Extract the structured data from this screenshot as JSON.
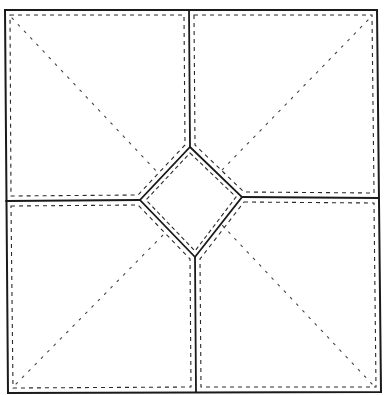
{
  "diagram": {
    "title": "",
    "width": 388,
    "height": 395,
    "background": "#ffffff",
    "colors": {
      "seam": "#1a1a1a",
      "stitch": "#2a2a2a",
      "quilt": "#444444"
    },
    "outer_frame": [
      [
        5,
        10
      ],
      [
        377,
        10
      ],
      [
        381,
        392
      ],
      [
        8,
        393
      ]
    ],
    "center_diamond": {
      "top": [
        190,
        147
      ],
      "right": [
        242,
        197
      ],
      "bottom": [
        195,
        257
      ],
      "left": [
        140,
        200
      ]
    },
    "seams": [
      {
        "name": "top-seam",
        "from": [
          189,
          10
        ],
        "to": [
          190,
          147
        ]
      },
      {
        "name": "right-seam",
        "from": [
          242,
          197
        ],
        "to": [
          379,
          198
        ]
      },
      {
        "name": "bottom-seam",
        "from": [
          195,
          257
        ],
        "to": [
          196,
          392
        ]
      },
      {
        "name": "left-seam",
        "from": [
          6,
          201
        ],
        "to": [
          140,
          200
        ]
      }
    ],
    "panels": [
      {
        "name": "panel-top-left",
        "outline": [
          [
            5,
            10
          ],
          [
            189,
            10
          ],
          [
            190,
            147
          ],
          [
            140,
            200
          ],
          [
            6,
            201
          ]
        ],
        "stitch_inset": [
          [
            10,
            15
          ],
          [
            184,
            15
          ],
          [
            185,
            145
          ],
          [
            138,
            195
          ],
          [
            11,
            196
          ]
        ],
        "quilt_line": {
          "from": [
            12,
            18
          ],
          "to": [
            160,
            175
          ]
        }
      },
      {
        "name": "panel-top-right",
        "outline": [
          [
            189,
            10
          ],
          [
            377,
            10
          ],
          [
            379,
            198
          ],
          [
            242,
            197
          ],
          [
            190,
            147
          ]
        ],
        "stitch_inset": [
          [
            194,
            15
          ],
          [
            372,
            15
          ],
          [
            374,
            193
          ],
          [
            244,
            192
          ],
          [
            195,
            145
          ]
        ],
        "quilt_line": {
          "from": [
            368,
            20
          ],
          "to": [
            222,
            170
          ]
        }
      },
      {
        "name": "panel-bottom-left",
        "outline": [
          [
            6,
            201
          ],
          [
            140,
            200
          ],
          [
            195,
            257
          ],
          [
            196,
            392
          ],
          [
            8,
            393
          ]
        ],
        "stitch_inset": [
          [
            11,
            206
          ],
          [
            138,
            205
          ],
          [
            190,
            259
          ],
          [
            191,
            387
          ],
          [
            13,
            388
          ]
        ],
        "quilt_line": {
          "from": [
            16,
            384
          ],
          "to": [
            166,
            232
          ]
        }
      },
      {
        "name": "panel-bottom-right",
        "outline": [
          [
            242,
            197
          ],
          [
            379,
            198
          ],
          [
            381,
            392
          ],
          [
            196,
            392
          ],
          [
            195,
            257
          ]
        ],
        "stitch_inset": [
          [
            244,
            202
          ],
          [
            374,
            203
          ],
          [
            376,
            387
          ],
          [
            201,
            387
          ],
          [
            200,
            259
          ]
        ],
        "quilt_line": {
          "from": [
            372,
            384
          ],
          "to": [
            222,
            225
          ]
        }
      }
    ],
    "diamond_stitch_inset": [
      [
        190,
        153
      ],
      [
        236,
        197
      ],
      [
        195,
        251
      ],
      [
        146,
        200
      ]
    ],
    "legend": []
  }
}
